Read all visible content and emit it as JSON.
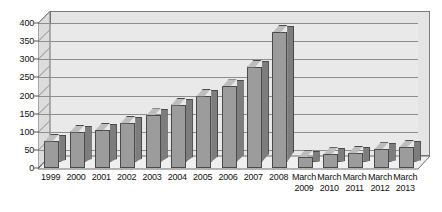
{
  "chart_data": {
    "type": "bar",
    "title": "",
    "subtitle": "",
    "xlabel": "",
    "ylabel": "",
    "ylim": [
      0,
      400
    ],
    "ytick_step": 50,
    "yticks": [
      "400",
      "350",
      "300",
      "250",
      "200",
      "150",
      "100",
      "50",
      "0"
    ],
    "grid": true,
    "legend": "none",
    "style": "3d-column",
    "categories": [
      "1999",
      "2000",
      "2001",
      "2002",
      "2003",
      "2004",
      "2005",
      "2006",
      "2007",
      "2008",
      "March 2009",
      "March 2010",
      "March 2011",
      "March 2012",
      "March 2013"
    ],
    "category_lines": [
      [
        "1999",
        ""
      ],
      [
        "2000",
        ""
      ],
      [
        "2001",
        ""
      ],
      [
        "2002",
        ""
      ],
      [
        "2003",
        ""
      ],
      [
        "2004",
        ""
      ],
      [
        "2005",
        ""
      ],
      [
        "2006",
        ""
      ],
      [
        "2007",
        ""
      ],
      [
        "2008",
        ""
      ],
      [
        "March",
        "2009"
      ],
      [
        "March",
        "2010"
      ],
      [
        "March",
        "2011"
      ],
      [
        "March",
        "2012"
      ],
      [
        "March",
        "2013"
      ]
    ],
    "values": [
      75,
      100,
      105,
      125,
      145,
      175,
      200,
      225,
      280,
      375,
      30,
      38,
      42,
      52,
      58
    ],
    "series": [
      {
        "name": "",
        "values": [
          75,
          100,
          105,
          125,
          145,
          175,
          200,
          225,
          280,
          375,
          30,
          38,
          42,
          52,
          58
        ]
      }
    ],
    "colors": {
      "bar_face": "#9c9c9c",
      "bar_side": "#7d7d7d",
      "bar_top": "#bdbdbd",
      "bar_outline": "#4a4a4a",
      "plot_background": "#e9e9e9",
      "plot_back_wall": "#e4e4e4",
      "side_wall": "#dcdcdc",
      "floor": "#efefef",
      "gridline": "#8d8d8d",
      "text": "#111111",
      "page_background": "#ffffff"
    }
  }
}
